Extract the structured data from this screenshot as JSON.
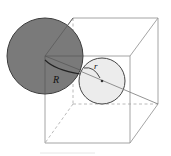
{
  "diagram": {
    "title": "",
    "labels": {
      "large_radius": "R",
      "small_radius": "r"
    },
    "colors": {
      "large_sphere_fill": "#7a7a7a",
      "small_sphere_fill": "#ececec",
      "edge": "#9a9a9a",
      "outline": "#444444"
    },
    "elements": [
      {
        "type": "cube",
        "edges_visible": 9,
        "edges_hidden": 3
      },
      {
        "type": "sphere",
        "name": "large",
        "label": "R"
      },
      {
        "type": "sphere",
        "name": "small",
        "label": "r"
      },
      {
        "type": "segment",
        "name": "space-diagonal"
      }
    ]
  }
}
